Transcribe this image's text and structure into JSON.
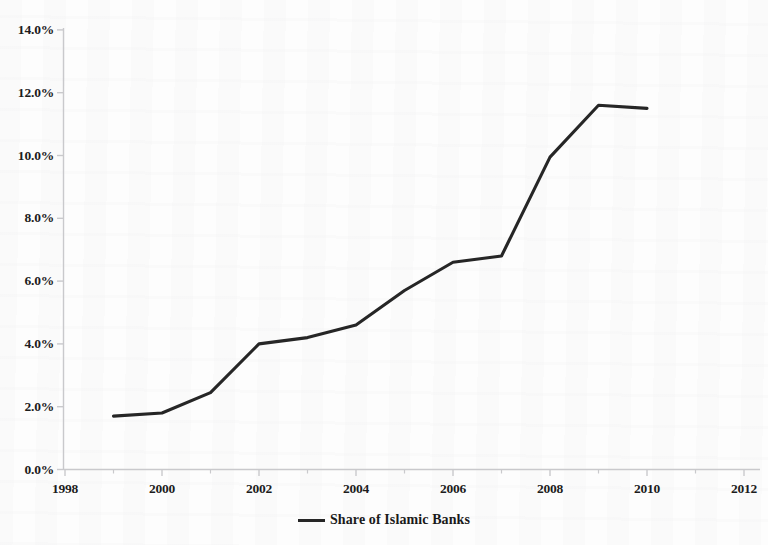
{
  "chart_data": {
    "type": "line",
    "title": "",
    "xlabel": "",
    "ylabel": "",
    "xlim": [
      1998,
      2012
    ],
    "ylim": [
      0,
      14
    ],
    "grid": false,
    "legend_position": "bottom",
    "x": [
      1999,
      2000,
      2001,
      2002,
      2003,
      2004,
      2005,
      2006,
      2007,
      2008,
      2009,
      2010
    ],
    "series": [
      {
        "name": "Share of Islamic Banks",
        "color": "#262626",
        "values": [
          1.7,
          1.8,
          2.45,
          4.0,
          4.2,
          4.6,
          5.7,
          6.6,
          6.8,
          9.95,
          11.6,
          11.5
        ]
      }
    ],
    "y_ticks": [
      0,
      2,
      4,
      6,
      8,
      10,
      12,
      14
    ],
    "y_tick_labels": [
      "0.0%",
      "2.0%",
      "4.0%",
      "6.0%",
      "8.0%",
      "10.0%",
      "12.0%",
      "14.0%"
    ],
    "x_ticks": [
      1998,
      2000,
      2002,
      2004,
      2006,
      2008,
      2010,
      2012
    ],
    "x_tick_labels": [
      "1998",
      "2000",
      "2002",
      "2004",
      "2006",
      "2008",
      "2010",
      "2012"
    ],
    "x_minor_ticks": [
      1999,
      2001,
      2003,
      2005,
      2007,
      2009,
      2011
    ]
  },
  "legend": {
    "entry_label": "Share of Islamic Banks"
  },
  "axes": {
    "axis_color": "#c9c9cc",
    "line_color": "#262626"
  }
}
